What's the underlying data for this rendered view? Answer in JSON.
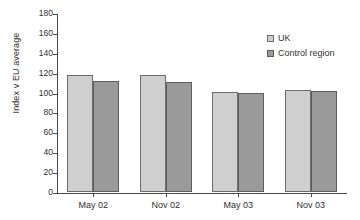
{
  "chart_data": {
    "type": "bar",
    "title": "",
    "subtitle": "",
    "xlabel": "",
    "ylabel": "Index v EU average",
    "categories": [
      "May 02",
      "Nov 02",
      "May 03",
      "Nov 03"
    ],
    "series": [
      {
        "name": "UK",
        "color": "#cfcfcf",
        "values": [
          118,
          118,
          101,
          103
        ]
      },
      {
        "name": "Control region",
        "color": "#9a9a9a",
        "values": [
          112,
          111,
          100,
          102
        ]
      }
    ],
    "ylim": [
      0,
      180
    ],
    "yticks": [
      0,
      20,
      40,
      60,
      80,
      100,
      120,
      140,
      160,
      180
    ],
    "ytick_labels": [
      "0",
      "20",
      "40",
      "60",
      "80",
      "100",
      "120",
      "140",
      "160",
      "180"
    ],
    "grid": false,
    "legend_position": "top-right",
    "annotations": []
  },
  "legend": {
    "entries": [
      {
        "label": "UK"
      },
      {
        "label": "Control region"
      }
    ]
  }
}
